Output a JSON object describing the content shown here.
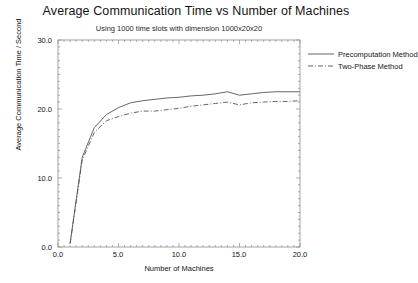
{
  "chart_data": {
    "type": "line",
    "title": "Average Communication Time vs Number of Machines",
    "subtitle": "Using 1000 time slots with dimension 1000x20x20",
    "xlabel": "Number of Machines",
    "ylabel": "Average Communication Time / Second",
    "xlim": [
      0.0,
      20.0
    ],
    "ylim": [
      0.0,
      30.0
    ],
    "xticks": [
      "0.0",
      "5.0",
      "10.0",
      "15.0",
      "20.0"
    ],
    "xtick_values": [
      0,
      5,
      10,
      15,
      20
    ],
    "yticks": [
      "0.0",
      "10.0",
      "20.0",
      "30.0"
    ],
    "ytick_values": [
      0,
      10,
      20,
      30
    ],
    "grid": false,
    "minor_ticks": true,
    "legend_position": "top-right-outside",
    "x": [
      1,
      2,
      3,
      4,
      5,
      6,
      7,
      8,
      9,
      10,
      11,
      12,
      13,
      14,
      15,
      16,
      17,
      18,
      19,
      20
    ],
    "series": [
      {
        "name": "Precomputation Method",
        "style": "solid",
        "color": "#555555",
        "values": [
          0.5,
          13.0,
          17.3,
          19.2,
          20.2,
          20.9,
          21.2,
          21.4,
          21.6,
          21.7,
          21.9,
          22.0,
          22.2,
          22.5,
          22.0,
          22.2,
          22.4,
          22.5,
          22.5,
          22.5
        ]
      },
      {
        "name": "Two-Phase Method",
        "style": "dashdot",
        "color": "#555555",
        "values": [
          0.5,
          12.6,
          16.6,
          18.3,
          18.9,
          19.4,
          19.7,
          19.7,
          19.9,
          20.1,
          20.4,
          20.6,
          20.8,
          21.0,
          20.6,
          20.9,
          21.0,
          21.1,
          21.1,
          21.2
        ]
      }
    ]
  },
  "legend": {
    "items": [
      {
        "label": "Precomputation Method"
      },
      {
        "label": "Two-Phase Method"
      }
    ]
  }
}
